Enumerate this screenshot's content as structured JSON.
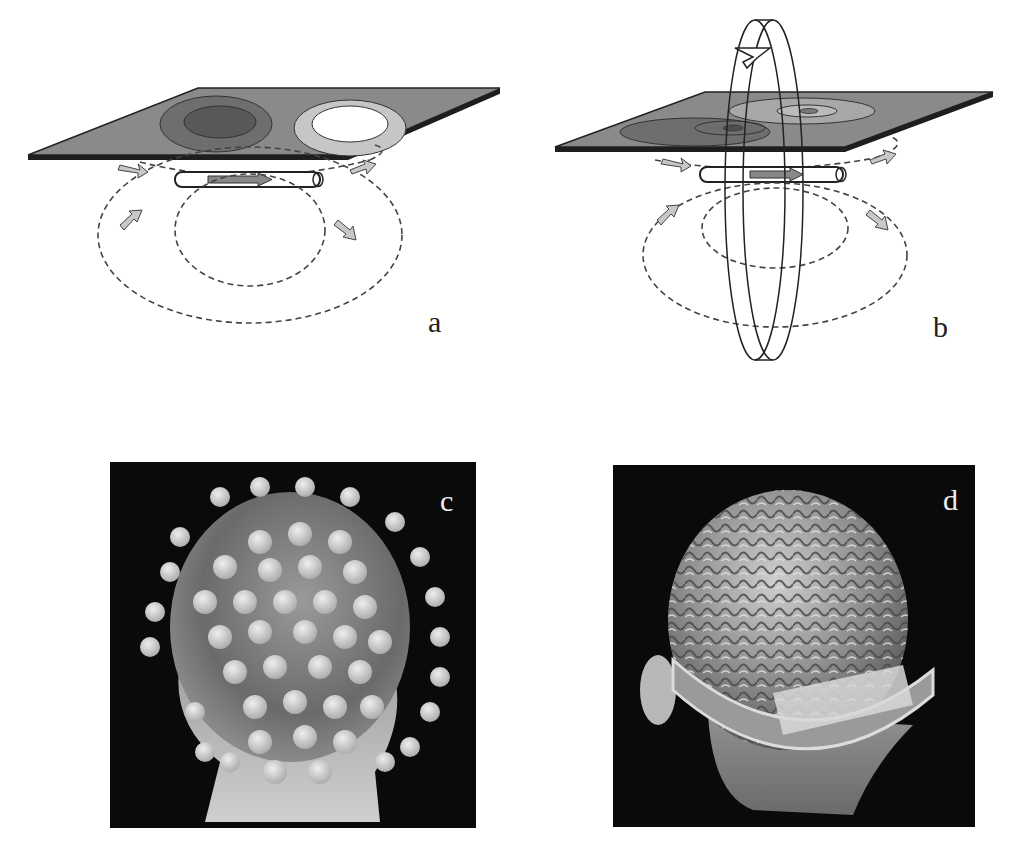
{
  "figure": {
    "panels": [
      {
        "id": "a",
        "label": "a",
        "description": "Planar sensor with dipole current and magnetic field loops"
      },
      {
        "id": "b",
        "label": "b",
        "description": "Planar sensor with dipole current, field loops and rotation ring"
      },
      {
        "id": "c",
        "label": "c",
        "description": "3D head model with EEG electrode array"
      },
      {
        "id": "d",
        "label": "d",
        "description": "3D head rendering with exposed brain cortex"
      }
    ],
    "colors": {
      "background": "#ffffff",
      "plane": "#8a8a8a",
      "plane_edge": "#1e1e1e",
      "dark_ring": "#5f5f5f",
      "light_ring": "#c8c8c8",
      "photo_bg": "#0a0a0a"
    }
  }
}
